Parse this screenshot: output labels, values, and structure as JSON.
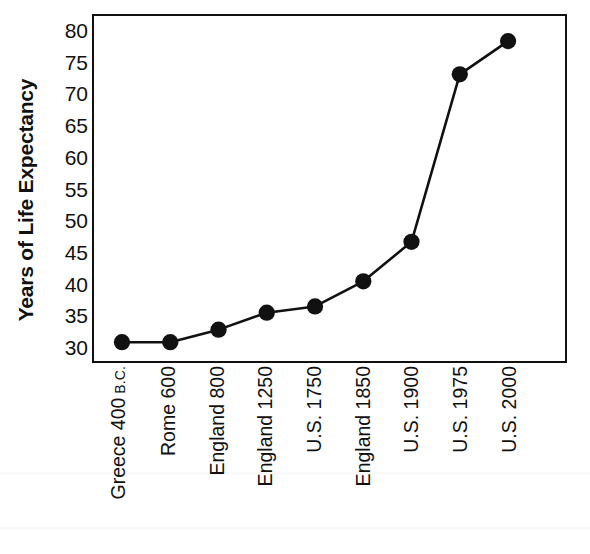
{
  "chart_data": {
    "type": "line",
    "title": "",
    "xlabel": "",
    "ylabel": "Years of Life Expectancy",
    "categories": [
      "Greece 400 B.C.",
      "Rome 600",
      "England 800",
      "England 1250",
      "U.S. 1750",
      "England 1850",
      "U.S. 1900",
      "U.S. 1975",
      "U.S. 2000"
    ],
    "category_parts": [
      {
        "main": "Greece 400",
        "era": "B.C."
      },
      {
        "main": "Rome 600",
        "era": ""
      },
      {
        "main": "England 800",
        "era": ""
      },
      {
        "main": "England 1250",
        "era": ""
      },
      {
        "main": "U.S. 1750",
        "era": ""
      },
      {
        "main": "England 1850",
        "era": ""
      },
      {
        "main": "U.S. 1900",
        "era": ""
      },
      {
        "main": "U.S. 1975",
        "era": ""
      },
      {
        "main": "U.S. 2000",
        "era": ""
      }
    ],
    "values": [
      30.5,
      30.5,
      32.5,
      35.2,
      36.2,
      40.2,
      46.5,
      73.2,
      78.5
    ],
    "ylim": [
      27.5,
      82.5
    ],
    "yticks": [
      30,
      35,
      40,
      45,
      50,
      55,
      60,
      65,
      70,
      75,
      80
    ],
    "ytick_labels": [
      "30",
      "35",
      "40",
      "45",
      "50",
      "55",
      "60",
      "65",
      "70",
      "75",
      "80"
    ],
    "grid": false,
    "legend": "none",
    "marker": "filled-circle",
    "line_color": "#111111",
    "marker_color": "#111111",
    "background_color": "#ffffff"
  }
}
